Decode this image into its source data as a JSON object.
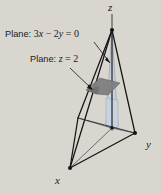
{
  "figure": {
    "type": "3d-geometry-diagram",
    "background_color": "#d9d6cf",
    "line_color": "#1a1a1a",
    "annotations": [
      {
        "name": "plane-3x-2y-0",
        "prefix": "Plane:",
        "equation": "3x − 2y = 0",
        "parts": {
          "coef1": "3",
          "var1": "x",
          "op1": "−",
          "coef2": "2",
          "var2": "y",
          "eq": "=",
          "rhs": "0"
        },
        "color": "#1a1a1a"
      },
      {
        "name": "plane-z-2",
        "prefix": "Plane:",
        "equation": "z = 2",
        "parts": {
          "var1": "z",
          "eq": "=",
          "rhs": "2"
        },
        "color": "#1a1a1a"
      }
    ],
    "axes": [
      {
        "name": "z-axis",
        "label": "z"
      },
      {
        "name": "y-axis",
        "label": "y"
      },
      {
        "name": "x-axis",
        "label": "x"
      }
    ],
    "shapes": {
      "vertical_plane": {
        "name": "plane-3x-2y-0-surface",
        "fill": "#c3cedd",
        "opacity": 0.72,
        "stroke": "#7d8896"
      },
      "horizontal_plane": {
        "name": "plane-z-2-surface",
        "fill": "#7e7e80",
        "opacity": 0.9,
        "stroke": "#5d5d60"
      },
      "tetrahedron": {
        "name": "tetrahedron-wireframe",
        "stroke": "#141414",
        "fill": "none"
      }
    },
    "vertices": {
      "apex": [
        112,
        30
      ],
      "x_vertex": [
        70,
        168
      ],
      "y_vertex": [
        135,
        133
      ],
      "origin_base": [
        112,
        128
      ],
      "left_base": [
        78,
        118
      ]
    }
  }
}
